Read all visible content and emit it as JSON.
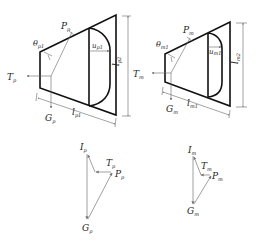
{
  "figure": {
    "left_block": {
      "labels": {
        "P": {
          "main": "P",
          "sub": "p"
        },
        "theta": {
          "main": "θ",
          "sub": "p1"
        },
        "u": {
          "main": "u",
          "sub": "p1"
        },
        "T": {
          "main": "T",
          "sub": "p"
        },
        "G": {
          "main": "G",
          "sub": "p"
        },
        "l_width": {
          "main": "l",
          "sub": "p1"
        },
        "l_height": {
          "main": "l",
          "sub": "p2"
        }
      }
    },
    "right_block": {
      "labels": {
        "P": {
          "main": "P",
          "sub": "m"
        },
        "theta": {
          "main": "θ",
          "sub": "m1"
        },
        "u": {
          "main": "u",
          "sub": "m1"
        },
        "T": {
          "main": "T",
          "sub": "m"
        },
        "G": {
          "main": "G",
          "sub": "m"
        },
        "l_width": {
          "main": "l",
          "sub": "m1"
        },
        "l_height": {
          "main": "l",
          "sub": "m2"
        }
      }
    },
    "left_polygon": {
      "labels": {
        "I": {
          "main": "I",
          "sub": "p"
        },
        "T": {
          "main": "T",
          "sub": "p"
        },
        "P": {
          "main": "P",
          "sub": "p"
        },
        "G": {
          "main": "G",
          "sub": "p"
        }
      }
    },
    "right_polygon": {
      "labels": {
        "I": {
          "main": "I",
          "sub": "m"
        },
        "T": {
          "main": "T",
          "sub": "m"
        },
        "P": {
          "main": "P",
          "sub": "m"
        },
        "G": {
          "main": "G",
          "sub": "m"
        }
      }
    },
    "colors": {
      "outline": "#111111",
      "dimension": "#666666",
      "vector": "#888888"
    }
  }
}
